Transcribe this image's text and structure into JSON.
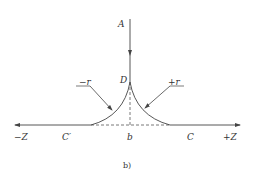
{
  "diagram": {
    "caption": "b)",
    "labels": {
      "A": "A",
      "D": "D",
      "minus_r": "−r",
      "plus_r": "+r",
      "minus_Z": "−Z",
      "C_prime": "C′",
      "b": "b",
      "C": "C",
      "plus_Z": "+Z"
    },
    "colors": {
      "line": "#444444",
      "background": "#ffffff"
    }
  }
}
